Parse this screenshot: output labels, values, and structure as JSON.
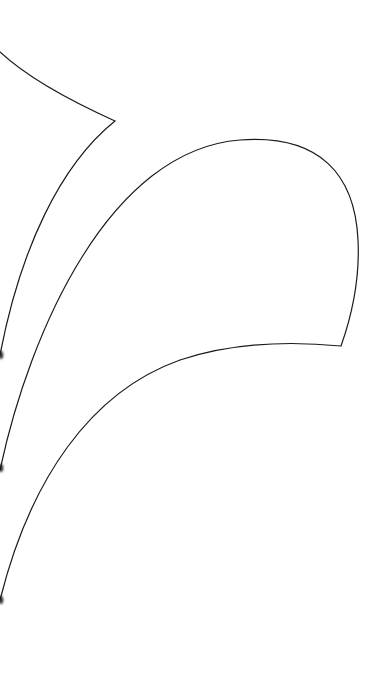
{
  "canvas": {
    "width": 387,
    "height": 681,
    "background": "#ffffff"
  },
  "style": {
    "stroke_color": "#1a1a1a",
    "stroke_width": 1.2,
    "smudge_color": "#2a2a2a"
  },
  "shapes": [
    {
      "name": "upper-cusp-curve",
      "d": "M 0 52 C 30 80, 75 103, 115 121 C 60 165, 20 250, 0 355"
    },
    {
      "name": "lower-loop-curve",
      "d": "M 0 470 C 30 330, 110 150, 240 140 C 320 134, 355 175, 358 240 C 360 280, 352 315, 341 346 C 300 342, 240 340, 180 360 C 90 392, 30 480, 0 600"
    }
  ],
  "edge_marks": [
    {
      "name": "left-edge-mark-1",
      "x": 1,
      "y": 355
    },
    {
      "name": "left-edge-mark-2",
      "x": 1,
      "y": 468
    },
    {
      "name": "left-edge-mark-3",
      "x": 1,
      "y": 600
    }
  ]
}
